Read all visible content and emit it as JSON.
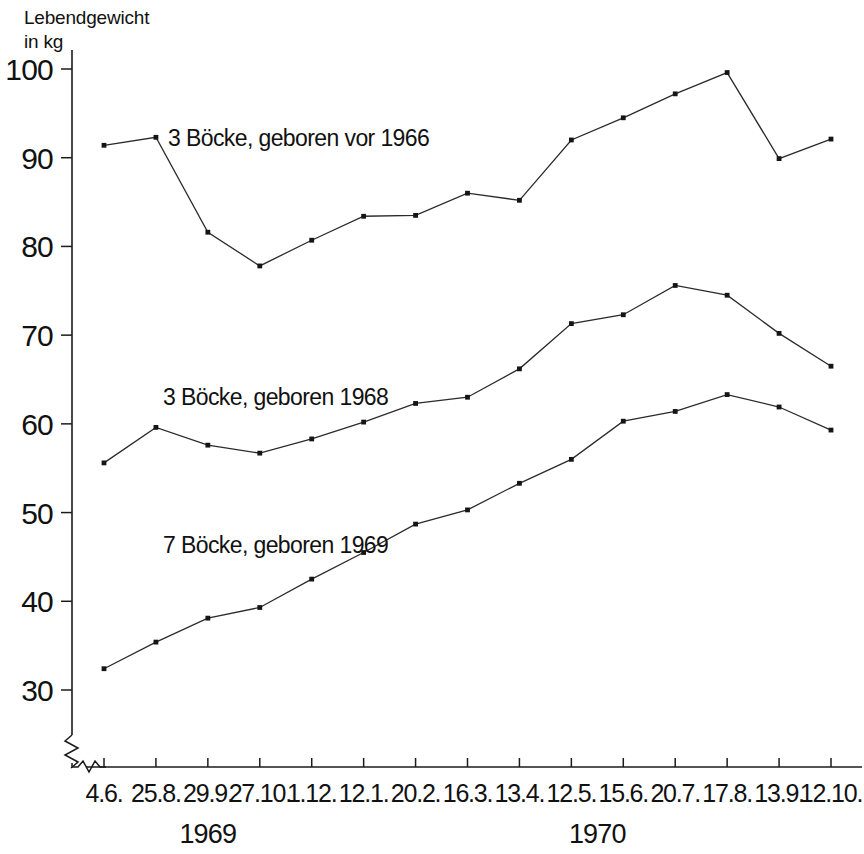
{
  "chart_data": {
    "type": "line",
    "title": "",
    "ylabel_line1": "Lebendgewicht",
    "ylabel_line2": "in kg",
    "xlabel": "",
    "ylim": [
      30,
      100
    ],
    "yticks": [
      100,
      90,
      80,
      70,
      60,
      50,
      40,
      30
    ],
    "grid": false,
    "legend_position": "inline-annotations",
    "axis_break": true,
    "categories": [
      "4.6.",
      "25.8.",
      "29.9.",
      "27.10.",
      "1.12.",
      "12.1.",
      "20.2.",
      "16.3.",
      "13.4.",
      "12.5.",
      "15.6.",
      "20.7.",
      "17.8.",
      "13.9.",
      "12.10."
    ],
    "period_groups": [
      {
        "label": "1969",
        "from_index": 0,
        "to_index": 4
      },
      {
        "label": "1970",
        "from_index": 5,
        "to_index": 14
      }
    ],
    "series": [
      {
        "name": "3 Böcke, geboren vor 1966",
        "values": [
          91.4,
          92.3,
          81.6,
          77.8,
          80.7,
          83.4,
          83.5,
          86.0,
          85.2,
          92.0,
          94.5,
          97.2,
          99.6,
          89.9,
          92.1
        ]
      },
      {
        "name": "3 Böcke, geboren 1968",
        "values": [
          55.6,
          59.6,
          57.6,
          56.7,
          58.3,
          60.2,
          62.3,
          63.0,
          66.2,
          71.3,
          72.3,
          75.6,
          74.5,
          70.2,
          66.5
        ]
      },
      {
        "name": "7 Böcke, geboren 1969",
        "values": [
          32.4,
          35.4,
          38.1,
          39.3,
          42.5,
          45.5,
          48.7,
          50.3,
          53.3,
          56.0,
          60.3,
          61.4,
          63.3,
          61.9,
          59.3
        ]
      }
    ],
    "annotations": [
      {
        "text": "3 Böcke, geboren vor 1966",
        "x_px": 168,
        "y_px": 146
      },
      {
        "text": "3 Böcke, geboren 1968",
        "x_px": 163,
        "y_px": 405
      },
      {
        "text": "7 Böcke, geboren 1969",
        "x_px": 163,
        "y_px": 553
      }
    ],
    "colors": {
      "line": "#2b2b2b",
      "marker": "#151515",
      "axis": "#1b1b1b",
      "background": "#ffffff",
      "text": "#111111"
    }
  }
}
